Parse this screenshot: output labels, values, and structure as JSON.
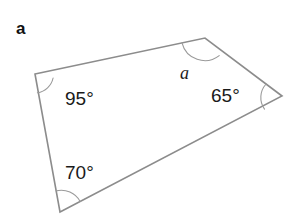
{
  "figure": {
    "part_label": "a",
    "canvas": {
      "width": 294,
      "height": 222,
      "background": "#ffffff"
    },
    "stroke_color": "#8c8c8c",
    "arc_color": "#9a9a9a",
    "text_color": "#1a1a1a"
  },
  "shape": {
    "name": "quadrilateral",
    "vertices": [
      {
        "id": "left",
        "x": 35,
        "y": 74
      },
      {
        "id": "top",
        "x": 205,
        "y": 38
      },
      {
        "id": "right",
        "x": 282,
        "y": 96
      },
      {
        "id": "bottom",
        "x": 60,
        "y": 212
      }
    ],
    "edges": [
      {
        "from": "left",
        "to": "top"
      },
      {
        "from": "top",
        "to": "right"
      },
      {
        "from": "right",
        "to": "bottom"
      },
      {
        "from": "bottom",
        "to": "left"
      }
    ]
  },
  "angles": [
    {
      "id": "angle-left",
      "vertex": "left",
      "label": "95°",
      "known": true,
      "label_x": 65,
      "label_y": 89,
      "arc_path": "M 53.1 78.0 A 19 19 0 0 1 37.4 92.8"
    },
    {
      "id": "angle-top",
      "vertex": "top",
      "label": "a",
      "known": false,
      "label_x": 180,
      "label_y": 64,
      "arc_path": "M 182.0 42.8 A 23.5 23.5 0 0 0 219.2 55.6"
    },
    {
      "id": "angle-right",
      "vertex": "right",
      "label": "65°",
      "known": true,
      "label_x": 211,
      "label_y": 86,
      "arc_path": "M 266.1 84.0 A 20 20 0 0 0 264.5 109.1"
    },
    {
      "id": "angle-bottom",
      "vertex": "bottom",
      "label": "70°",
      "known": true,
      "label_x": 65,
      "label_y": 163,
      "arc_path": "M 56.1 190.9 A 21.5 21.5 0 0 1 80.1 201.4"
    }
  ]
}
